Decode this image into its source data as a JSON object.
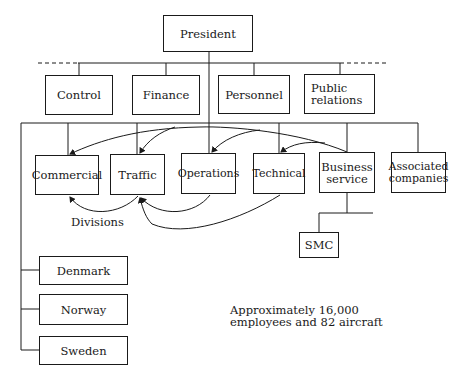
{
  "diagram": {
    "type": "organization-chart",
    "top": {
      "president": "President"
    },
    "staff": {
      "control": "Control",
      "finance": "Finance",
      "personnel": "Personnel",
      "public_relations": [
        "Public",
        "relations"
      ]
    },
    "divisions": {
      "commercial": "Commercial",
      "traffic": "Traffic",
      "operations": "Operations",
      "technical": "Technical",
      "business_service": [
        "Business",
        "service"
      ],
      "associated_companies": [
        "Associated",
        "companies"
      ]
    },
    "sub_units": {
      "smc": "SMC"
    },
    "countries": {
      "denmark": "Denmark",
      "norway": "Norway",
      "sweden": "Sweden"
    },
    "annotations": {
      "divisions_label": "Divisions",
      "summary_line1": "Approximately 16,000",
      "summary_line2": "employees and 82 aircraft"
    },
    "colors": {
      "line": "#1a1a1a",
      "background": "#ffffff"
    }
  }
}
